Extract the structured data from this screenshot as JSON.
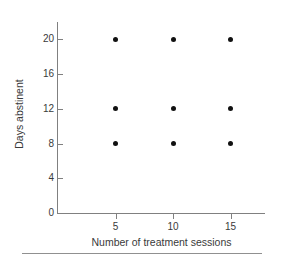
{
  "chart_data": {
    "type": "scatter",
    "title": "",
    "xlabel": "Number of treatment sessions",
    "ylabel": "Days abstinent",
    "xlim": [
      0,
      18
    ],
    "ylim": [
      0,
      22
    ],
    "grid": false,
    "legend": null,
    "x_ticks": [
      5,
      10,
      15
    ],
    "x_tick_labels": [
      "5",
      "10",
      "15"
    ],
    "y_ticks": [
      0,
      4,
      8,
      12,
      16,
      20
    ],
    "y_tick_labels": [
      "0",
      "4",
      "8",
      "12",
      "16",
      "20"
    ],
    "marker": "filled-circle",
    "marker_color": "#111111",
    "points": [
      {
        "x": 5,
        "y": 20
      },
      {
        "x": 10,
        "y": 20
      },
      {
        "x": 15,
        "y": 20
      },
      {
        "x": 5,
        "y": 12
      },
      {
        "x": 10,
        "y": 12
      },
      {
        "x": 15,
        "y": 12
      },
      {
        "x": 5,
        "y": 8
      },
      {
        "x": 10,
        "y": 8
      },
      {
        "x": 15,
        "y": 8
      }
    ],
    "x": [
      5,
      10,
      15,
      5,
      10,
      15,
      5,
      10,
      15
    ],
    "values": [
      20,
      20,
      20,
      12,
      12,
      12,
      8,
      8,
      8
    ],
    "axis_color": "#808080",
    "text_color": "#3a3a3a",
    "background": "#ffffff"
  }
}
